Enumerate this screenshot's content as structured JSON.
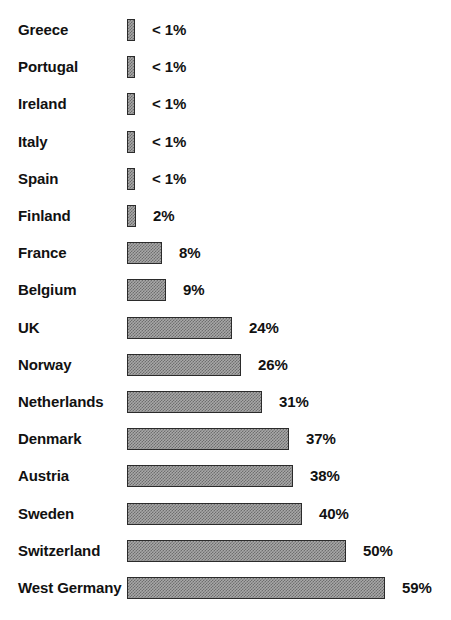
{
  "chart_data": {
    "type": "bar",
    "orientation": "horizontal",
    "title": "",
    "subtitle": "",
    "xlabel": "",
    "ylabel": "",
    "grid": false,
    "legend": null,
    "axis_visible": false,
    "xlim": [
      0,
      59
    ],
    "categories": [
      "Greece",
      "Portugal",
      "Ireland",
      "Italy",
      "Spain",
      "Finland",
      "France",
      "Belgium",
      "UK",
      "Norway",
      "Netherlands",
      "Denmark",
      "Austria",
      "Sweden",
      "Switzerland",
      "West Germany"
    ],
    "values": [
      0.5,
      0.5,
      0.5,
      0.5,
      0.5,
      2,
      8,
      9,
      24,
      26,
      31,
      37,
      38,
      40,
      50,
      59
    ],
    "value_labels": [
      "< 1%",
      "< 1%",
      "< 1%",
      "< 1%",
      "< 1%",
      "2%",
      "8%",
      "9%",
      "24%",
      "26%",
      "31%",
      "37%",
      "38%",
      "40%",
      "50%",
      "59%"
    ],
    "bar_style": {
      "fill": "#a8a8a8",
      "pattern": "checker-dither",
      "outline": "#2b2b2b"
    }
  },
  "layout": {
    "row_pitch": 37.2,
    "first_row_top": 17,
    "bar_left": 127,
    "px_per_percent": 4.37,
    "min_bar_px": 8,
    "label_gap": 17
  },
  "footer": {
    "clipped_caption": ""
  }
}
